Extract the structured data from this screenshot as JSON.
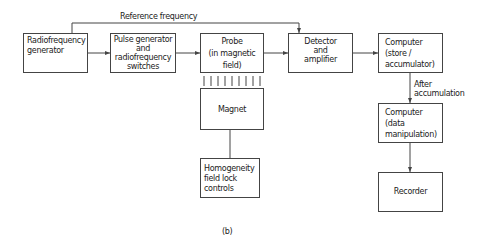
{
  "diagram": {
    "caption": "(b)",
    "reference_label": "Reference frequency",
    "after_label": "After\naccumulation",
    "blocks": [
      {
        "id": "rf_generator",
        "label": "Radiofrequency\ngenerator"
      },
      {
        "id": "pulse_generator",
        "label": "Pulse generator\nand\nradiofrequency\nswitches"
      },
      {
        "id": "probe",
        "label": "Probe\n(in magnetic\nfield)"
      },
      {
        "id": "magnet",
        "label": "Magnet"
      },
      {
        "id": "homogeneity",
        "label": "Homogeneity\nfield lock\ncontrols"
      },
      {
        "id": "detector",
        "label": "Detector\nand\namplifier"
      },
      {
        "id": "computer_store",
        "label": "Computer\n(store /\naccumulator)"
      },
      {
        "id": "computer_data",
        "label": "Computer\n(data\nmanipulation)"
      },
      {
        "id": "recorder",
        "label": "Recorder"
      }
    ],
    "connections": [
      {
        "from": "rf_generator",
        "to": "pulse_generator",
        "arrow": true
      },
      {
        "from": "pulse_generator",
        "to": "probe",
        "arrow": true
      },
      {
        "from": "probe",
        "to": "detector",
        "arrow": true
      },
      {
        "from": "detector",
        "to": "computer_store",
        "arrow": true
      },
      {
        "from": "computer_store",
        "to": "computer_data",
        "arrow": true,
        "label": "After accumulation"
      },
      {
        "from": "computer_data",
        "to": "recorder",
        "arrow": true
      },
      {
        "from": "rf_generator",
        "to": "detector",
        "arrow": true,
        "label": "Reference frequency"
      },
      {
        "from": "probe",
        "to": "magnet",
        "arrow": false,
        "style": "field-lines"
      },
      {
        "from": "magnet",
        "to": "homogeneity",
        "arrow": false
      }
    ]
  }
}
